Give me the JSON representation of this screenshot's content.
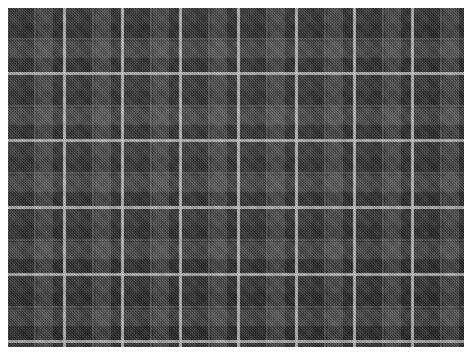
{
  "image": {
    "subject": "tartan-fabric-swatch",
    "description": "Dark grey and black tartan plaid woven textile swatch",
    "width": 464,
    "height": 355,
    "background": "#ffffff"
  },
  "fabric": {
    "left": 8,
    "top": 8,
    "width": 456,
    "height": 339,
    "weave": "twill",
    "palette": {
      "ground_black": "#141414",
      "dark_charcoal": "#1e1e1e",
      "mid_grey": "#2e2e2e",
      "light_grey": "#3a3a3a",
      "highlight_grey": "#454545",
      "accent_white": "#d6d6d6"
    },
    "sett": {
      "warp_repeat_px": 58,
      "weft_repeat_px": 67,
      "accent_line_width_px": 3,
      "companion_line_width_px": 2
    },
    "bands": {
      "vertical": [
        {
          "color": "#1b1b1b",
          "width_px": 14
        },
        {
          "color": "#121212",
          "width_px": 15
        },
        {
          "color": "#2f2f2f",
          "width_px": 16
        },
        {
          "color": "#121212",
          "width_px": 13
        }
      ],
      "horizontal": [
        {
          "color": "#1b1b1b",
          "width_px": 16
        },
        {
          "color": "#101010",
          "width_px": 17
        },
        {
          "color": "#2d2d2d",
          "width_px": 17
        },
        {
          "color": "#101010",
          "width_px": 17
        }
      ]
    },
    "accent_lines": {
      "vertical_x": [
        55,
        113,
        171,
        229,
        287,
        345,
        403
      ],
      "horizontal_y": [
        26,
        93,
        160,
        227,
        294
      ]
    }
  },
  "margins": {
    "left_px": 8,
    "top_px": 8,
    "bottom_px": 8,
    "right_px": 0
  }
}
